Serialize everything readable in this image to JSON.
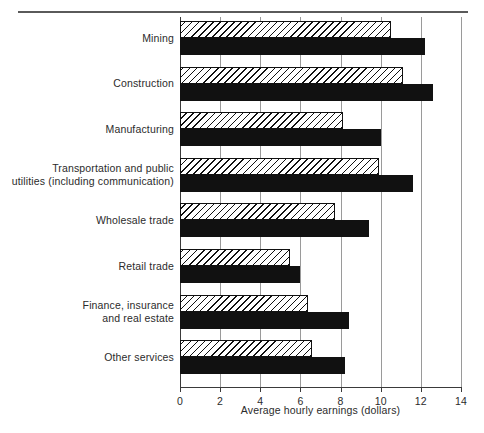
{
  "figure": {
    "has_top_rule": true,
    "background_color": "#ffffff",
    "ink_color": "#111111",
    "grid_color": "#9a9a9a"
  },
  "chart_data": {
    "type": "bar",
    "orientation": "horizontal",
    "title": "",
    "subtitle": "",
    "xlabel": "Average hourly earnings (dollars)",
    "ylabel": "",
    "xlim": [
      0,
      14
    ],
    "xticks": [
      0,
      2,
      4,
      6,
      8,
      10,
      12,
      14
    ],
    "xtick_labels": [
      "0",
      "2",
      "4",
      "6",
      "8",
      "10",
      "12",
      "14"
    ],
    "grid": true,
    "grid_axis": "x",
    "legend": [],
    "legend_position": "none",
    "categories": [
      "Mining",
      "Construction",
      "Manufacturing",
      "Transportation and public utilities (including communication)",
      "Wholesale trade",
      "Retail trade",
      "Finance, insurance and real estate",
      "Other services"
    ],
    "category_labels_multiline": [
      [
        "Mining"
      ],
      [
        "Construction"
      ],
      [
        "Manufacturing"
      ],
      [
        "Transportation and public",
        "utilities (including communication)"
      ],
      [
        "Wholesale trade"
      ],
      [
        "Retail trade"
      ],
      [
        "Finance, insurance",
        "and real estate"
      ],
      [
        "Other services"
      ]
    ],
    "series": [
      {
        "name": "hatched",
        "style": "diagonal-hatch",
        "values": [
          10.5,
          11.1,
          8.1,
          9.9,
          7.7,
          5.5,
          6.4,
          6.6
        ]
      },
      {
        "name": "solid",
        "style": "solid-black",
        "values": [
          12.2,
          12.6,
          10.0,
          11.6,
          9.4,
          6.0,
          8.4,
          8.2
        ]
      }
    ]
  }
}
